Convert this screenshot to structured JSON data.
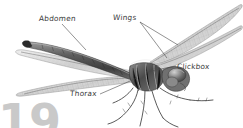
{
  "figure": {
    "style": "grayscale-engraving",
    "background_color": "#ffffff",
    "ink_color": "#3a3a3a",
    "page_number": "19",
    "page_number_color": "#c9c9c9"
  },
  "labels": {
    "abdomen": "Abdomen",
    "wings": "Wings",
    "clickbox": "Clickbox",
    "thorax": "Thorax"
  },
  "leaders": {
    "abdomen": "from label down-right to abdomen segment",
    "wings": "two branching lines to upper and lower right wings",
    "clickbox": "from label left to wing base",
    "thorax": "from label up-right to thorax"
  }
}
